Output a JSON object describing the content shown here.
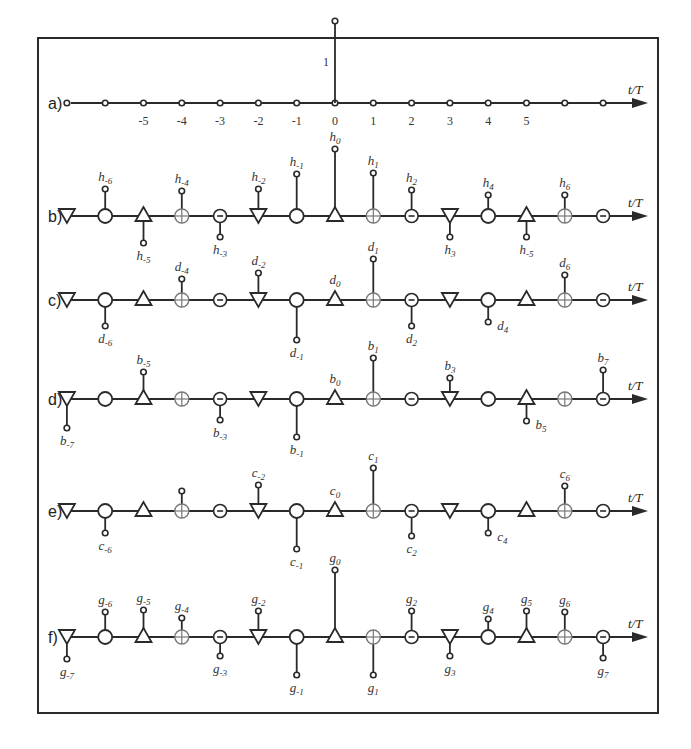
{
  "figure": {
    "axis_label": "t/T",
    "center_x": 335,
    "spacing": 38.3,
    "rows": [
      {
        "id": "a",
        "label": "a)",
        "y": 103,
        "type": "impulse",
        "ticks": [
          "-5",
          "-4",
          "-3",
          "-2",
          "-1",
          "0",
          "1",
          "2",
          "3",
          "4",
          "5"
        ],
        "tick_indices": [
          -5,
          -4,
          -3,
          -2,
          -1,
          0,
          1,
          2,
          3,
          4,
          5
        ],
        "impulse_index": 0,
        "impulse_label": "1",
        "impulse_height": 82
      },
      {
        "id": "b",
        "label": "b)",
        "y": 216,
        "letter": "h",
        "stems": [
          {
            "k": -6,
            "dir": "up",
            "h": 20,
            "sub": "-6"
          },
          {
            "k": -5,
            "dir": "down",
            "h": 20,
            "sub": "-5"
          },
          {
            "k": -4,
            "dir": "up",
            "h": 18,
            "sub": "-4"
          },
          {
            "k": -3,
            "dir": "down",
            "h": 14,
            "sub": "-3"
          },
          {
            "k": -2,
            "dir": "up",
            "h": 20,
            "sub": "-2"
          },
          {
            "k": -1,
            "dir": "up",
            "h": 35,
            "sub": "-1"
          },
          {
            "k": 0,
            "dir": "up",
            "h": 60,
            "sub": "0"
          },
          {
            "k": 1,
            "dir": "up",
            "h": 36,
            "sub": "1"
          },
          {
            "k": 2,
            "dir": "up",
            "h": 19,
            "sub": "2"
          },
          {
            "k": 3,
            "dir": "down",
            "h": 14,
            "sub": "3"
          },
          {
            "k": 4,
            "dir": "up",
            "h": 14,
            "sub": "4"
          },
          {
            "k": 5,
            "dir": "down",
            "h": 14,
            "sub": "-5"
          },
          {
            "k": 6,
            "dir": "up",
            "h": 14,
            "sub": "6"
          }
        ]
      },
      {
        "id": "c",
        "label": "c)",
        "y": 300,
        "letter": "d",
        "stems": [
          {
            "k": -6,
            "dir": "down",
            "h": 19,
            "sub": "-6"
          },
          {
            "k": -4,
            "dir": "up",
            "h": 14,
            "sub": "-4"
          },
          {
            "k": -2,
            "dir": "up",
            "h": 20,
            "sub": "-2"
          },
          {
            "k": -1,
            "dir": "down",
            "h": 33,
            "sub": "-1"
          },
          {
            "k": 0,
            "dir": "none",
            "h": 0,
            "sub": "0"
          },
          {
            "k": 1,
            "dir": "up",
            "h": 34,
            "sub": "1"
          },
          {
            "k": 2,
            "dir": "down",
            "h": 19,
            "sub": "2"
          },
          {
            "k": 4,
            "dir": "down",
            "h": 15,
            "sub": "4"
          },
          {
            "k": 6,
            "dir": "up",
            "h": 18,
            "sub": "6"
          }
        ]
      },
      {
        "id": "d",
        "label": "d)",
        "y": 399,
        "letter": "b",
        "stems": [
          {
            "k": -7,
            "dir": "down",
            "h": 22,
            "sub": "-7"
          },
          {
            "k": -5,
            "dir": "up",
            "h": 20,
            "sub": "-5"
          },
          {
            "k": -3,
            "dir": "down",
            "h": 14,
            "sub": "-3"
          },
          {
            "k": -1,
            "dir": "down",
            "h": 31,
            "sub": "-1"
          },
          {
            "k": 0,
            "dir": "none",
            "h": 0,
            "sub": "0"
          },
          {
            "k": 1,
            "dir": "up",
            "h": 34,
            "sub": "1"
          },
          {
            "k": 3,
            "dir": "up",
            "h": 14,
            "sub": "3"
          },
          {
            "k": 5,
            "dir": "down",
            "h": 15,
            "sub": "5"
          },
          {
            "k": 7,
            "dir": "up",
            "h": 22,
            "sub": "7"
          }
        ]
      },
      {
        "id": "e",
        "label": "e)",
        "y": 511,
        "letter": "c",
        "stems": [
          {
            "k": -6,
            "dir": "down",
            "h": 15,
            "sub": "-6"
          },
          {
            "k": -4,
            "dir": "up",
            "h": 13,
            "sub": "-4",
            "hide_label": true
          },
          {
            "k": -2,
            "dir": "up",
            "h": 19,
            "sub": "-2"
          },
          {
            "k": -1,
            "dir": "down",
            "h": 31,
            "sub": "-1"
          },
          {
            "k": 0,
            "dir": "none",
            "h": 0,
            "sub": "0"
          },
          {
            "k": 1,
            "dir": "up",
            "h": 36,
            "sub": "1"
          },
          {
            "k": 2,
            "dir": "down",
            "h": 18,
            "sub": "2"
          },
          {
            "k": 4,
            "dir": "down",
            "h": 15,
            "sub": "4"
          },
          {
            "k": 6,
            "dir": "up",
            "h": 18,
            "sub": "6"
          }
        ]
      },
      {
        "id": "f",
        "label": "f)",
        "y": 637,
        "letter": "g",
        "stems": [
          {
            "k": -7,
            "dir": "down",
            "h": 15,
            "sub": "-7"
          },
          {
            "k": -6,
            "dir": "up",
            "h": 18,
            "sub": "-6"
          },
          {
            "k": -5,
            "dir": "up",
            "h": 20,
            "sub": "-5"
          },
          {
            "k": -4,
            "dir": "up",
            "h": 12,
            "sub": "-4"
          },
          {
            "k": -3,
            "dir": "down",
            "h": 12,
            "sub": "-3"
          },
          {
            "k": -2,
            "dir": "up",
            "h": 19,
            "sub": "-2"
          },
          {
            "k": -1,
            "dir": "down",
            "h": 31,
            "sub": "-1"
          },
          {
            "k": 0,
            "dir": "up",
            "h": 60,
            "sub": "0"
          },
          {
            "k": 1,
            "dir": "down",
            "h": 31,
            "sub": "1"
          },
          {
            "k": 2,
            "dir": "up",
            "h": 19,
            "sub": "2"
          },
          {
            "k": 3,
            "dir": "down",
            "h": 12,
            "sub": "3"
          },
          {
            "k": 4,
            "dir": "up",
            "h": 11,
            "sub": "4"
          },
          {
            "k": 5,
            "dir": "up",
            "h": 19,
            "sub": "5"
          },
          {
            "k": 6,
            "dir": "up",
            "h": 18,
            "sub": "6"
          },
          {
            "k": 7,
            "dir": "down",
            "h": 14,
            "sub": "7"
          }
        ]
      }
    ],
    "symbol_cycle": [
      "tri-down",
      "circle",
      "tri-up",
      "circle-plus",
      "circle-minus"
    ],
    "symbol_cycle_start_index": -7
  }
}
